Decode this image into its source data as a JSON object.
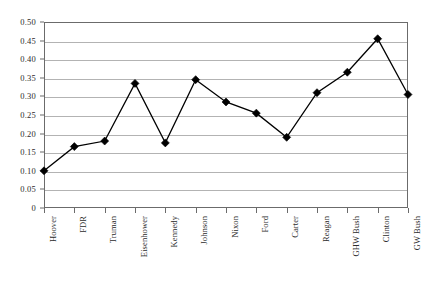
{
  "chart_data": {
    "type": "line",
    "title": "",
    "subtitle": "",
    "xlabel": "",
    "ylabel": "",
    "categories": [
      "Hoover",
      "FDR",
      "Truman",
      "Eisenhower",
      "Kennedy",
      "Johnson",
      "Nixon",
      "Ford",
      "Carter",
      "Reagan",
      "GHW Bush",
      "Clinton",
      "GW Bush"
    ],
    "values": [
      0.1,
      0.165,
      0.18,
      0.335,
      0.175,
      0.345,
      0.285,
      0.255,
      0.19,
      0.31,
      0.365,
      0.455,
      0.305
    ],
    "series": [
      {
        "name": "",
        "values": [
          0.1,
          0.165,
          0.18,
          0.335,
          0.175,
          0.345,
          0.285,
          0.255,
          0.19,
          0.31,
          0.365,
          0.455,
          0.305
        ]
      }
    ],
    "ylim": [
      0,
      0.5
    ],
    "ytick_values": [
      0,
      0.05,
      0.1,
      0.15,
      0.2,
      0.25,
      0.3,
      0.35,
      0.4,
      0.45,
      0.5
    ],
    "ytick_labels": [
      "0",
      "0.05",
      "0.10",
      "0.15",
      "0.20",
      "0.25",
      "0.30",
      "0.35",
      "0.40",
      "0.45",
      "0.50"
    ],
    "grid": true,
    "legend": false,
    "legend_position": "none",
    "marker": "diamond",
    "marker_color": "#000000",
    "line_color": "#000000",
    "grid_color": "#b3b3b3",
    "frame_color": "#6b6b6b",
    "background": "#ffffff",
    "annotations": []
  }
}
